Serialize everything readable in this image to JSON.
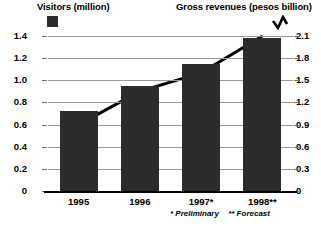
{
  "legend": {
    "left": {
      "label": "Visitors (million)",
      "marker": "filled-square",
      "color": "#2b2b2b"
    },
    "right": {
      "label": "Gross revenues (pesos billion)",
      "marker": "zigzag-line",
      "color": "#000000"
    }
  },
  "footnotes": {
    "preliminary": "* Preliminary",
    "forecast": "** Forecast"
  },
  "chart_data": {
    "type": "bar",
    "title": "",
    "subtitle": "",
    "xlabel": "",
    "ylabel": "Visitors (million)",
    "y2label": "Gross revenues (pesos billion)",
    "categories": [
      "1995",
      "1996",
      "1997*",
      "1998**"
    ],
    "grid": true,
    "legend_position": "top",
    "ylim": [
      0,
      1.4
    ],
    "y2lim": [
      0,
      2.1
    ],
    "yticks": [
      "0",
      "0.2",
      "0.4",
      "0.6",
      "0.8",
      "1.0",
      "1.2",
      "1.4"
    ],
    "ytick_values": [
      0,
      0.2,
      0.4,
      0.6,
      0.8,
      1.0,
      1.2,
      1.4
    ],
    "y2ticks": [
      "0",
      "0.3",
      "0.6",
      "0.9",
      "1.2",
      "1.5",
      "1.8",
      "2.1"
    ],
    "y2tick_values": [
      0,
      0.3,
      0.6,
      0.9,
      1.2,
      1.5,
      1.8,
      2.1
    ],
    "series": [
      {
        "name": "Visitors (million)",
        "type": "bar",
        "axis": "left",
        "color": "#2b2b2b",
        "values": [
          0.72,
          0.95,
          1.15,
          1.38
        ]
      },
      {
        "name": "Gross revenues (pesos billion)",
        "type": "line",
        "axis": "right",
        "color": "#000000",
        "values": [
          0.9,
          1.35,
          1.6,
          2.1
        ]
      }
    ]
  }
}
